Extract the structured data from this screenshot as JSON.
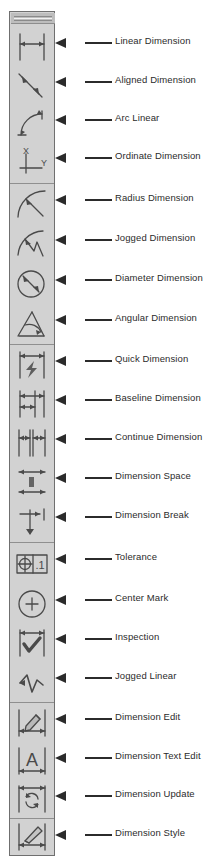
{
  "window": {
    "type": "floating-toolbar",
    "title": "Dimension Toolbar",
    "grip_label": "",
    "colors": {
      "toolbar_face": "#d2d2d2",
      "toolbar_border": "#6f6f6f",
      "grip": "#bdbdbd",
      "separator": "#8f8f8f",
      "icon_stroke": "#4a4a4a",
      "callout": "#2b2b2b",
      "label_text": "#2b2b2b",
      "page_background": "#ffffff"
    }
  },
  "toolbar": {
    "items": [
      {
        "icon": "linear-dimension-icon",
        "label": "Linear Dimension",
        "group": 1,
        "group_end": false
      },
      {
        "icon": "aligned-dimension-icon",
        "label": "Aligned Dimension",
        "group": 1,
        "group_end": false
      },
      {
        "icon": "arc-linear-icon",
        "label": "Arc Linear",
        "group": 1,
        "group_end": false
      },
      {
        "icon": "ordinate-dimension-icon",
        "label": "Ordinate Dimension",
        "group": 1,
        "group_end": true
      },
      {
        "icon": "radius-dimension-icon",
        "label": "Radius Dimension",
        "group": 2,
        "group_end": false
      },
      {
        "icon": "jogged-dimension-icon",
        "label": "Jogged Dimension",
        "group": 2,
        "group_end": false
      },
      {
        "icon": "diameter-dimension-icon",
        "label": "Diameter Dimension",
        "group": 2,
        "group_end": false
      },
      {
        "icon": "angular-dimension-icon",
        "label": "Angular Dimension",
        "group": 2,
        "group_end": true
      },
      {
        "icon": "quick-dimension-icon",
        "label": "Quick Dimension",
        "group": 3,
        "group_end": false
      },
      {
        "icon": "baseline-dimension-icon",
        "label": "Baseline Dimension",
        "group": 3,
        "group_end": false
      },
      {
        "icon": "continue-dimension-icon",
        "label": "Continue Dimension",
        "group": 3,
        "group_end": false
      },
      {
        "icon": "dimension-space-icon",
        "label": "Dimension Space",
        "group": 3,
        "group_end": false
      },
      {
        "icon": "dimension-break-icon",
        "label": "Dimension Break",
        "group": 3,
        "group_end": true
      },
      {
        "icon": "tolerance-icon",
        "label": "Tolerance",
        "group": 4,
        "group_end": false
      },
      {
        "icon": "center-mark-icon",
        "label": "Center Mark",
        "group": 4,
        "group_end": false
      },
      {
        "icon": "inspection-icon",
        "label": "Inspection",
        "group": 4,
        "group_end": false
      },
      {
        "icon": "jogged-linear-icon",
        "label": "Jogged Linear",
        "group": 4,
        "group_end": true
      },
      {
        "icon": "dimension-edit-icon",
        "label": "Dimension Edit",
        "group": 5,
        "group_end": false
      },
      {
        "icon": "dimension-text-edit-icon",
        "label": "Dimension Text Edit",
        "group": 5,
        "group_end": false
      },
      {
        "icon": "dimension-update-icon",
        "label": "Dimension Update",
        "group": 5,
        "group_end": true
      },
      {
        "icon": "dimension-style-icon",
        "label": "Dimension Style",
        "group": 6,
        "group_end": false
      }
    ],
    "glyphs": {
      "tolerance_value": ".1",
      "dimension_text_glyph": "A",
      "ordinate_x": "X",
      "ordinate_y": "Y"
    }
  }
}
